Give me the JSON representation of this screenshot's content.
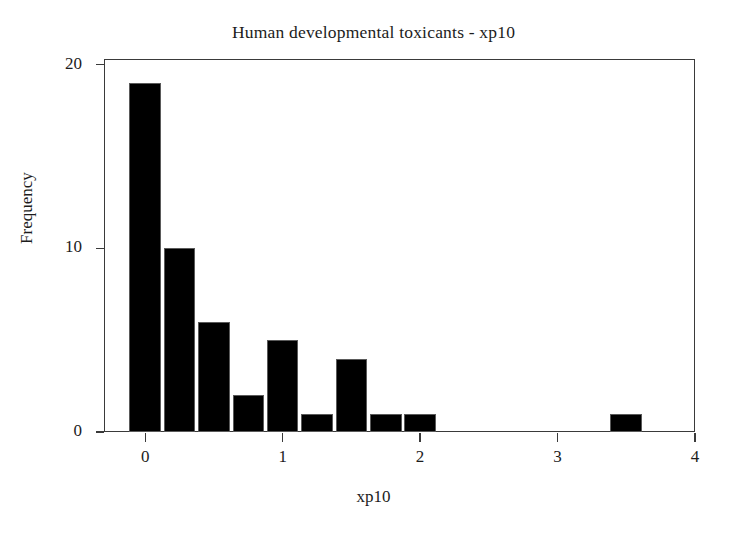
{
  "chart_data": {
    "type": "bar",
    "title": "Human developmental toxicants - xp10",
    "xlabel": "xp10",
    "ylabel": "Frequency",
    "x": [
      0,
      0.25,
      0.5,
      0.75,
      1,
      1.25,
      1.5,
      1.75,
      2,
      3.5
    ],
    "values": [
      19,
      10,
      6,
      2,
      5,
      1,
      4,
      1,
      1,
      1
    ],
    "categories": [
      "0",
      "0.25",
      "0.5",
      "0.75",
      "1",
      "1.25",
      "1.5",
      "1.75",
      "2",
      "3.5"
    ],
    "bin_width": 0.25,
    "xlim": [
      -0.3,
      4.0
    ],
    "ylim": [
      0,
      20.3
    ],
    "xticks": [
      0,
      1,
      2,
      3,
      4
    ],
    "xticklabels": [
      "0",
      "1",
      "2",
      "3",
      "4"
    ],
    "yticks": [
      0,
      10,
      20
    ],
    "yticklabels": [
      "0",
      "10",
      "20"
    ],
    "grid": false,
    "legend": false,
    "legend_position": "none",
    "bar_color": "#000000",
    "frame_color": "#3a3a3a",
    "background": "#ffffff"
  }
}
